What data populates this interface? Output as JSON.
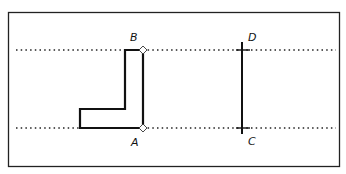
{
  "diagram": {
    "labels": {
      "A": "A",
      "B": "B",
      "C": "C",
      "D": "D"
    },
    "colors": {
      "stroke": "#111111",
      "background": "#ffffff"
    }
  }
}
